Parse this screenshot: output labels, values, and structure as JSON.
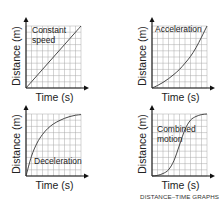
{
  "caption": "DISTANCE–TIME GRAPHS",
  "chart_data": [
    {
      "type": "line",
      "title": "Constant speed",
      "label_lines": [
        "Constant",
        "speed"
      ],
      "xlabel": "Time (s)",
      "ylabel": "Distance (m)",
      "x": [
        0,
        1,
        2,
        3,
        4,
        5,
        6,
        7,
        8,
        9,
        10
      ],
      "values": [
        0,
        1,
        2,
        3,
        4,
        5,
        6,
        7,
        8,
        9,
        10
      ],
      "grid": true
    },
    {
      "type": "line",
      "title": "Acceleration",
      "label_lines": [
        "Acceleration"
      ],
      "xlabel": "Time (s)",
      "ylabel": "Distance (m)",
      "x": [
        0,
        1,
        2,
        3,
        4,
        5,
        6,
        7,
        8,
        9,
        10
      ],
      "values": [
        0,
        0.4,
        0.9,
        1.5,
        2.2,
        3.0,
        4.0,
        5.1,
        6.5,
        8.2,
        10
      ],
      "grid": true
    },
    {
      "type": "line",
      "title": "Deceleration",
      "label_lines": [
        "Deceleration"
      ],
      "xlabel": "Time (s)",
      "ylabel": "Distance (m)",
      "x": [
        0,
        1,
        2,
        3,
        4,
        5,
        6,
        7,
        8,
        9,
        10
      ],
      "values": [
        0,
        3.2,
        5.3,
        6.7,
        7.7,
        8.4,
        8.9,
        9.3,
        9.6,
        9.8,
        9.9
      ],
      "grid": true
    },
    {
      "type": "line",
      "title": "Combined motion",
      "label_lines": [
        "Combined",
        "motion"
      ],
      "xlabel": "Time (s)",
      "ylabel": "Distance (m)",
      "x": [
        0,
        1,
        2,
        3,
        4,
        5,
        6,
        7,
        8,
        9,
        10
      ],
      "values": [
        0,
        0.1,
        0.4,
        1.0,
        2.5,
        5.0,
        7.5,
        9.0,
        9.6,
        9.9,
        10
      ],
      "grid": true
    }
  ]
}
